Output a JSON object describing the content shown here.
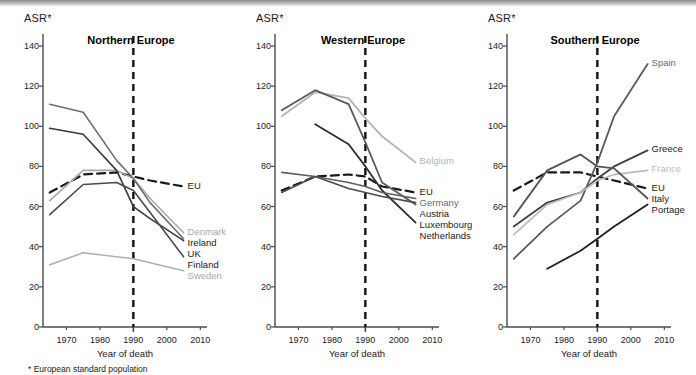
{
  "figure": {
    "axis_label": "ASR*",
    "xlabel": "Year of death",
    "footnote": "* European standard population",
    "reference_year": 1990
  },
  "chart_data": [
    {
      "type": "line",
      "title": "Northern Europe",
      "xlabel": "Year of death",
      "ylabel": "ASR*",
      "xlim": [
        1963,
        2012
      ],
      "ylim": [
        0,
        140
      ],
      "yticks": [
        0,
        20,
        40,
        60,
        80,
        100,
        120,
        140
      ],
      "ytick_labels": [
        "0",
        "20",
        "40",
        "60",
        "80",
        "100",
        "120",
        "140"
      ],
      "xticks": [
        1970,
        1980,
        1990,
        2000,
        2010
      ],
      "xtick_labels": [
        "1970",
        "1980",
        "1990",
        "2000",
        "2010"
      ],
      "grid": false,
      "legend_position": "right-inline",
      "annotations": [
        {
          "text": "vertical dashed reference line",
          "x": 1990
        }
      ],
      "series": [
        {
          "name": "EU",
          "color": "#1a1a1a",
          "style": "dashed",
          "width": 2.2,
          "x": [
            1965,
            1975,
            1985,
            1990,
            1995,
            2005
          ],
          "values": [
            67,
            76,
            77,
            75,
            73,
            70
          ]
        },
        {
          "name": "Denmark",
          "color": "#a8a8a8",
          "style": "solid",
          "width": 1.6,
          "x": [
            1965,
            1975,
            1985,
            1990,
            1995,
            2005
          ],
          "values": [
            63,
            78,
            78,
            74,
            64,
            47
          ]
        },
        {
          "name": "Ireland",
          "color": "#6e6e6e",
          "style": "solid",
          "width": 1.6,
          "x": [
            1965,
            1975,
            1985,
            1990,
            1995,
            2005
          ],
          "values": [
            111,
            107,
            83,
            74,
            62,
            44
          ]
        },
        {
          "name": "UK",
          "color": "#3a3a3a",
          "style": "solid",
          "width": 1.6,
          "x": [
            1965,
            1975,
            1985,
            1990,
            1995,
            2005
          ],
          "values": [
            99,
            96,
            78,
            60,
            54,
            43
          ]
        },
        {
          "name": "Finland",
          "color": "#4a4a4a",
          "style": "solid",
          "width": 1.6,
          "x": [
            1965,
            1975,
            1985,
            1990,
            1995,
            2005
          ],
          "values": [
            56,
            71,
            72,
            68,
            57,
            35
          ]
        },
        {
          "name": "Sweden",
          "color": "#b0b0b0",
          "style": "solid",
          "width": 1.6,
          "x": [
            1965,
            1975,
            1985,
            1990,
            1995,
            2005
          ],
          "values": [
            31,
            37,
            35,
            34,
            32,
            28
          ]
        }
      ],
      "labels": [
        {
          "name": "EU",
          "color": "#1a1a1a",
          "value": 70
        },
        {
          "name": "Denmark",
          "color": "#a8a8a8",
          "value": 47
        },
        {
          "name": "Ireland",
          "color": "#1a1a1a",
          "value": 44
        },
        {
          "name": "UK",
          "color": "#1a1a1a",
          "value": 43
        },
        {
          "name": "Finland",
          "color": "#1a1a1a",
          "value": 35
        },
        {
          "name": "Sweden",
          "color": "#a8a8a8",
          "value": 28
        }
      ]
    },
    {
      "type": "line",
      "title": "Western Europe",
      "xlabel": "Year of death",
      "ylabel": "ASR*",
      "xlim": [
        1963,
        2012
      ],
      "ylim": [
        0,
        140
      ],
      "yticks": [
        0,
        20,
        40,
        60,
        80,
        100,
        120,
        140
      ],
      "ytick_labels": [
        "0",
        "20",
        "40",
        "60",
        "80",
        "100",
        "120",
        "140"
      ],
      "xticks": [
        1970,
        1980,
        1990,
        2000,
        2010
      ],
      "xtick_labels": [
        "1970",
        "1980",
        "1990",
        "2000",
        "2010"
      ],
      "grid": false,
      "legend_position": "right-inline",
      "annotations": [
        {
          "text": "vertical dashed reference line",
          "x": 1990
        }
      ],
      "series": [
        {
          "name": "EU",
          "color": "#1a1a1a",
          "style": "dashed",
          "width": 2.2,
          "x": [
            1965,
            1975,
            1985,
            1990,
            1995,
            2005
          ],
          "values": [
            68,
            75,
            76,
            75,
            70,
            67
          ]
        },
        {
          "name": "Belgium",
          "color": "#b3b3b3",
          "style": "solid",
          "width": 1.8,
          "x": [
            1965,
            1975,
            1985,
            1990,
            1995,
            2005
          ],
          "values": [
            105,
            117,
            114,
            104,
            95,
            82
          ]
        },
        {
          "name": "Luxembourg",
          "color": "#5a5a5a",
          "style": "solid",
          "width": 1.8,
          "x": [
            1965,
            1975,
            1985,
            1990,
            1995,
            2005
          ],
          "values": [
            108,
            118,
            111,
            92,
            72,
            61
          ]
        },
        {
          "name": "Netherlands",
          "color": "#2e2e2e",
          "style": "solid",
          "width": 1.8,
          "x": [
            1975,
            1985,
            1990,
            1995,
            2005
          ],
          "values": [
            101,
            91,
            80,
            68,
            52
          ]
        },
        {
          "name": "Germany",
          "color": "#5f5f5f",
          "style": "solid",
          "width": 1.6,
          "x": [
            1965,
            1975,
            1985,
            1990,
            1995,
            2005
          ],
          "values": [
            77,
            75,
            72,
            70,
            67,
            64
          ]
        },
        {
          "name": "Austria",
          "color": "#4a4a4a",
          "style": "solid",
          "width": 1.6,
          "x": [
            1965,
            1975,
            1985,
            1990,
            1995,
            2005
          ],
          "values": [
            67,
            75,
            69,
            67,
            65,
            62
          ]
        }
      ],
      "labels": [
        {
          "name": "Belgium",
          "color": "#b3b3b3",
          "value": 82
        },
        {
          "name": "EU",
          "color": "#1a1a1a",
          "value": 67
        },
        {
          "name": "Germany",
          "color": "#6a6a6a",
          "value": 64
        },
        {
          "name": "Austria",
          "color": "#1a1a1a",
          "value": 62
        },
        {
          "name": "Netherlands",
          "color": "#1a1a1a",
          "value": 52
        },
        {
          "name": "Luxembourg",
          "color": "#1a1a1a",
          "value": 61
        }
      ]
    },
    {
      "type": "line",
      "title": "Southern Europe",
      "xlabel": "Year of death",
      "ylabel": "ASR*",
      "xlim": [
        1963,
        2012
      ],
      "ylim": [
        0,
        140
      ],
      "yticks": [
        0,
        20,
        40,
        60,
        80,
        100,
        120,
        140
      ],
      "ytick_labels": [
        "0",
        "20",
        "40",
        "60",
        "80",
        "100",
        "120",
        "140"
      ],
      "xticks": [
        1970,
        1980,
        1990,
        2000,
        2010
      ],
      "xtick_labels": [
        "1970",
        "1980",
        "1990",
        "2000",
        "2010"
      ],
      "grid": false,
      "legend_position": "right-inline",
      "annotations": [
        {
          "text": "vertical dashed reference line",
          "x": 1990
        }
      ],
      "series": [
        {
          "name": "EU",
          "color": "#1a1a1a",
          "style": "dashed",
          "width": 2.2,
          "x": [
            1965,
            1975,
            1985,
            1990,
            1995,
            2005
          ],
          "values": [
            68,
            77,
            77,
            75,
            73,
            69
          ]
        },
        {
          "name": "Spain",
          "color": "#5a5a5a",
          "style": "solid",
          "width": 1.8,
          "x": [
            1965,
            1975,
            1985,
            1990,
            1995,
            2005
          ],
          "values": [
            34,
            50,
            63,
            82,
            105,
            131
          ]
        },
        {
          "name": "Greece",
          "color": "#3f3f3f",
          "style": "solid",
          "width": 1.8,
          "x": [
            1965,
            1975,
            1985,
            1990,
            1995,
            2005
          ],
          "values": [
            50,
            62,
            67,
            74,
            80,
            88
          ]
        },
        {
          "name": "France",
          "color": "#bdbdbd",
          "style": "solid",
          "width": 1.8,
          "x": [
            1965,
            1975,
            1985,
            1990,
            1995,
            2005
          ],
          "values": [
            46,
            61,
            67,
            73,
            76,
            78
          ]
        },
        {
          "name": "Italy",
          "color": "#555555",
          "style": "solid",
          "width": 1.8,
          "x": [
            1965,
            1975,
            1985,
            1990,
            1995,
            2005
          ],
          "values": [
            55,
            78,
            86,
            80,
            79,
            64
          ]
        },
        {
          "name": "Portage",
          "color": "#1f1f1f",
          "style": "solid",
          "width": 1.8,
          "x": [
            1975,
            1985,
            1990,
            1995,
            2005
          ],
          "values": [
            29,
            38,
            44,
            50,
            61
          ]
        }
      ],
      "labels": [
        {
          "name": "Spain",
          "color": "#6a6a6a",
          "value": 131
        },
        {
          "name": "Greece",
          "color": "#1a1a1a",
          "value": 88
        },
        {
          "name": "France",
          "color": "#bdbdbd",
          "value": 78
        },
        {
          "name": "EU",
          "color": "#1a1a1a",
          "value": 69
        },
        {
          "name": "Italy",
          "color": "#1a1a1a",
          "value": 64
        },
        {
          "name": "Portage",
          "color": "#1a1a1a",
          "value": 61
        }
      ]
    }
  ]
}
